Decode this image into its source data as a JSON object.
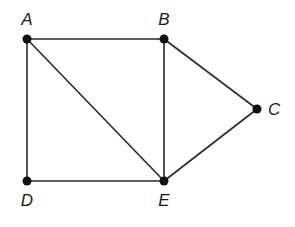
{
  "diagram": {
    "type": "graph",
    "nodes": [
      {
        "id": "A",
        "label": "A",
        "x": 27,
        "y": 39,
        "label_x": 27,
        "label_y": 25,
        "anchor": "middle"
      },
      {
        "id": "B",
        "label": "B",
        "x": 164,
        "y": 39,
        "label_x": 164,
        "label_y": 25,
        "anchor": "middle"
      },
      {
        "id": "C",
        "label": "C",
        "x": 257,
        "y": 109,
        "label_x": 268,
        "label_y": 115,
        "anchor": "start"
      },
      {
        "id": "D",
        "label": "D",
        "x": 27,
        "y": 181,
        "label_x": 27,
        "label_y": 206,
        "anchor": "middle"
      },
      {
        "id": "E",
        "label": "E",
        "x": 164,
        "y": 181,
        "label_x": 164,
        "label_y": 206,
        "anchor": "middle"
      }
    ],
    "edges": [
      {
        "from": "A",
        "to": "B"
      },
      {
        "from": "A",
        "to": "D"
      },
      {
        "from": "A",
        "to": "E"
      },
      {
        "from": "B",
        "to": "E"
      },
      {
        "from": "B",
        "to": "C"
      },
      {
        "from": "C",
        "to": "E"
      },
      {
        "from": "D",
        "to": "E"
      }
    ],
    "colors": {
      "edge": "#2a2a2a",
      "node": "#111111",
      "label": "#1a1a1a"
    }
  }
}
